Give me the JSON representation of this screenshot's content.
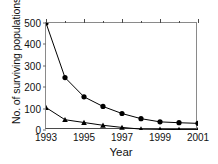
{
  "chart_data": {
    "type": "line",
    "title": "",
    "xlabel": "Year",
    "ylabel": "No. of surviving populations",
    "x": [
      1993,
      1994,
      1995,
      1996,
      1997,
      1998,
      1999,
      2000,
      2001
    ],
    "xlim": [
      1993,
      2001
    ],
    "ylim": [
      0,
      500
    ],
    "xticks": [
      1993,
      1995,
      1997,
      1999,
      2001
    ],
    "xtick_labels": [
      "1993",
      "1995",
      "1997",
      "1999",
      "2001"
    ],
    "xminorticks": [
      1994,
      1996,
      1998,
      2000
    ],
    "yticks": [
      0,
      100,
      200,
      300,
      400,
      500
    ],
    "ytick_labels": [
      "0",
      "100",
      "200",
      "300",
      "400",
      "500"
    ],
    "grid": false,
    "legend": "none",
    "series": [
      {
        "name": "circles",
        "marker": "circle",
        "color": "#000000",
        "values": [
          500,
          245,
          155,
          110,
          77,
          53,
          38,
          34,
          31
        ]
      },
      {
        "name": "triangles",
        "marker": "triangle",
        "color": "#000000",
        "values": [
          105,
          48,
          35,
          22,
          12,
          4,
          3,
          2,
          2
        ]
      }
    ]
  }
}
